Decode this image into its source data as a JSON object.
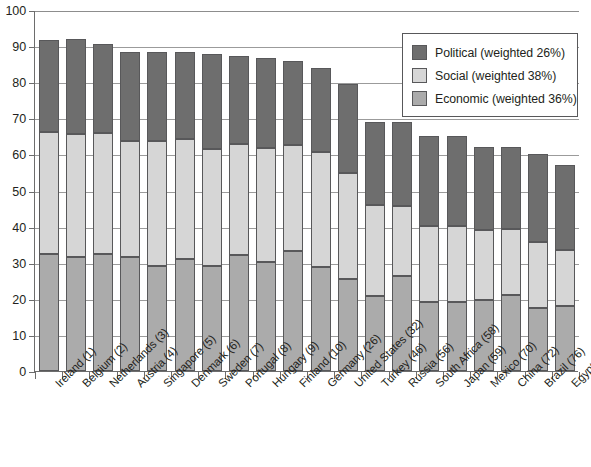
{
  "chart_data": {
    "type": "bar",
    "subtype": "stacked-vertical",
    "title": "",
    "xlabel": "",
    "ylabel": "",
    "ylim": [
      0,
      100
    ],
    "yticks": [
      0,
      10,
      20,
      30,
      40,
      50,
      60,
      70,
      80,
      90,
      100
    ],
    "grid": true,
    "grid_axis": "y",
    "legend_position": "top-right",
    "categories": [
      "Ireland (1)",
      "Belgium (2)",
      "Netherlands (3)",
      "Austria (4)",
      "Singapore (5)",
      "Denmark (6)",
      "Sweden (7)",
      "Portugal (8)",
      "Hungary (9)",
      "Finland (10)",
      "Germany (26)",
      "United States (32)",
      "Turkey (46)",
      "Russia (56)",
      "South Africa (58)",
      "Japan (59)",
      "Mexico (70)",
      "China (72)",
      "Brazil (76)",
      "Egypt (85)"
    ],
    "series": [
      {
        "name": "Economic (weighted 36%)",
        "color": "#ababab",
        "values": [
          32.5,
          31.5,
          32.5,
          31.5,
          29.2,
          31.0,
          29.2,
          32.2,
          30.2,
          33.3,
          28.7,
          25.5,
          20.7,
          26.2,
          19.0,
          19.2,
          19.7,
          21.0,
          17.5,
          18.0
        ]
      },
      {
        "name": "Social (weighted 38%)",
        "color": "#d6d6d6",
        "values": [
          33.7,
          34.2,
          33.3,
          32.2,
          34.6,
          33.3,
          32.3,
          30.6,
          31.6,
          29.4,
          31.9,
          29.3,
          25.2,
          19.6,
          21.2,
          21.0,
          19.4,
          18.3,
          18.2,
          15.5
        ]
      },
      {
        "name": "Political (weighted 26%)",
        "color": "#6e6e6e",
        "values": [
          25.5,
          26.3,
          24.8,
          24.8,
          24.5,
          24.1,
          26.4,
          24.5,
          24.9,
          23.3,
          23.4,
          24.7,
          23.2,
          23.2,
          24.8,
          24.8,
          22.9,
          22.7,
          24.3,
          23.5
        ]
      }
    ],
    "totals": [
      91.7,
      92.0,
      90.6,
      88.5,
      88.3,
      88.4,
      87.9,
      87.3,
      86.7,
      86.0,
      84.0,
      79.5,
      69.1,
      69.0,
      65.0,
      65.0,
      62.0,
      62.0,
      60.0,
      57.0
    ]
  },
  "legend": {
    "items": [
      {
        "label": "Political (weighted 26%)",
        "color": "#6e6e6e",
        "swatch_name": "legend-swatch-political"
      },
      {
        "label": "Social (weighted 38%)",
        "color": "#d6d6d6",
        "swatch_name": "legend-swatch-social"
      },
      {
        "label": "Economic (weighted 36%)",
        "color": "#ababab",
        "swatch_name": "legend-swatch-economic"
      }
    ]
  },
  "axis": {
    "y_tick_labels": [
      "100",
      "90",
      "80",
      "70",
      "60",
      "50",
      "40",
      "30",
      "20",
      "10",
      "0"
    ]
  }
}
